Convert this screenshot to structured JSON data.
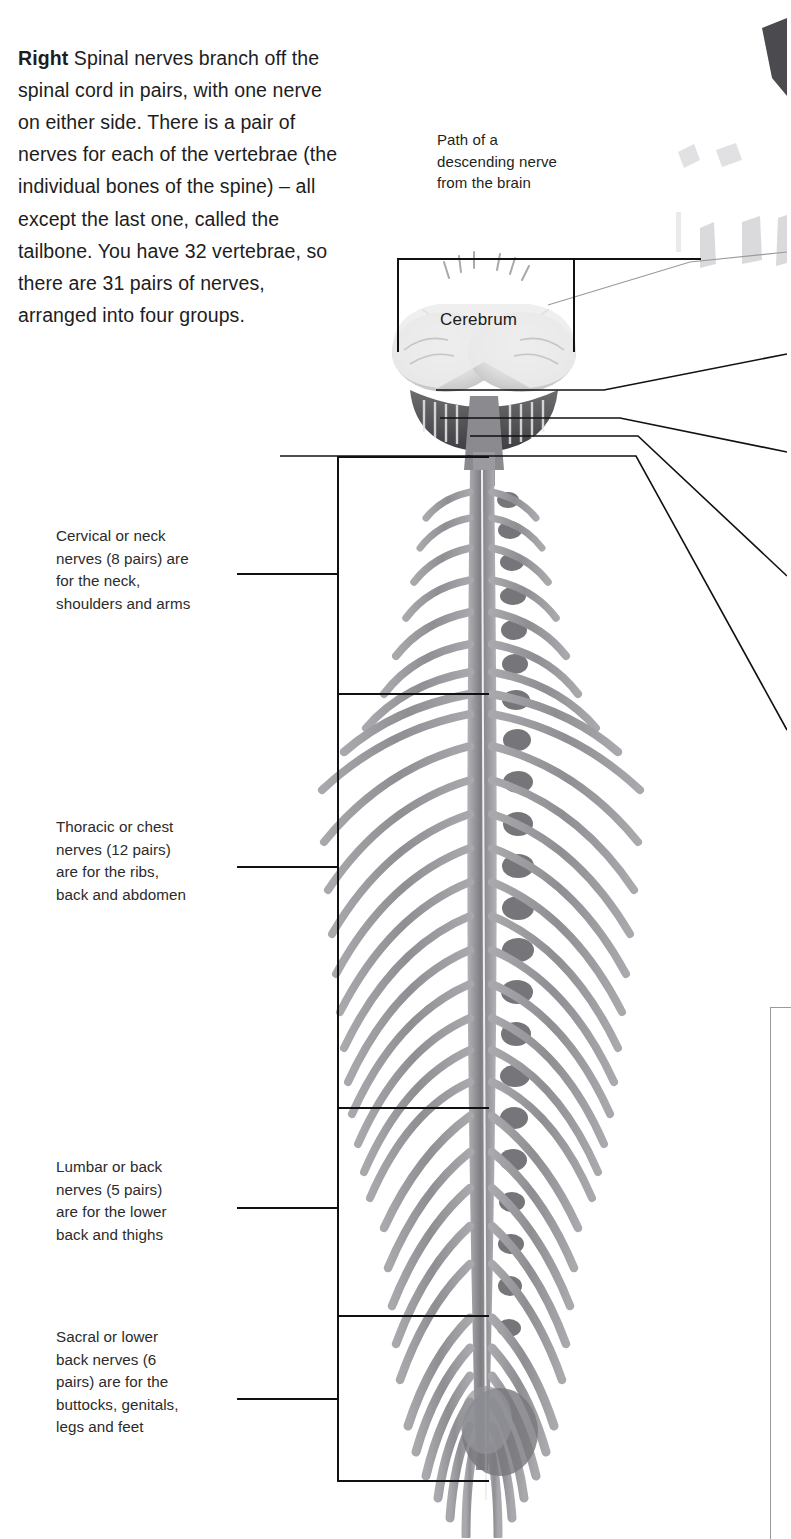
{
  "page": {
    "width": 787,
    "height": 1538,
    "background": "#ffffff",
    "text_color": "#1a1a1a",
    "line_color": "#111111",
    "anatomy_color": "#8c8c90"
  },
  "intro": {
    "lead": "Right",
    "body": " Spinal nerves branch off the spinal cord in pairs, with one nerve on either side. There is a pair of nerves for each of the vertebrae (the individual bones of the spine) – all except the last one, called the tailbone. You have 32 vertebrae, so there are 31 pairs of nerves, arranged into four groups."
  },
  "callouts": {
    "descending_nerve": "Path of a\ndescending nerve\nfrom the brain",
    "cerebrum": "Cerebrum"
  },
  "nerve_groups": [
    {
      "id": "cervical",
      "text": "Cervical or neck\nnerves (8 pairs) are\nfor the neck,\nshoulders and arms",
      "name": "Cervical",
      "region": "neck",
      "pairs": 8,
      "serves": "neck, shoulders and arms",
      "bracket_top": 456,
      "bracket_bottom": 693,
      "leader_y": 573
    },
    {
      "id": "thoracic",
      "text": "Thoracic or chest\nnerves (12 pairs)\nare for the ribs,\nback and abdomen",
      "name": "Thoracic",
      "region": "chest",
      "pairs": 12,
      "serves": "ribs, back and abdomen",
      "bracket_top": 693,
      "bracket_bottom": 1107,
      "leader_y": 866
    },
    {
      "id": "lumbar",
      "text": "Lumbar or back\nnerves (5 pairs)\nare for the lower\nback and thighs",
      "name": "Lumbar",
      "region": "back",
      "pairs": 5,
      "serves": "lower back and thighs",
      "bracket_top": 1107,
      "bracket_bottom": 1315,
      "leader_y": 1207
    },
    {
      "id": "sacral",
      "text": "Sacral or lower\nback nerves (6\npairs) are for the\nbuttocks, genitals,\nlegs and feet",
      "name": "Sacral",
      "region": "lower back",
      "pairs": 6,
      "serves": "buttocks, genitals, legs and feet",
      "bracket_top": 1315,
      "bracket_bottom": 1480,
      "leader_y": 1398
    }
  ],
  "facts": {
    "vertebrae_count": 32,
    "nerve_pair_count": 31,
    "group_count": 4
  }
}
